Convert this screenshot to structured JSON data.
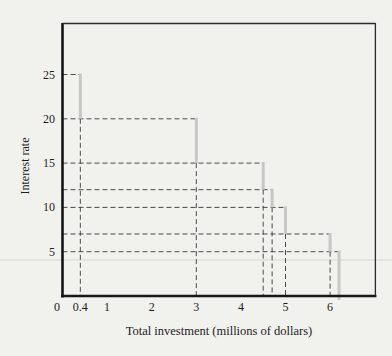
{
  "page": {
    "background_color": "#f1f1ee"
  },
  "chart_data": {
    "type": "step",
    "title": "",
    "xlabel": "Total investment (millions of dollars)",
    "ylabel": "Interest rate",
    "x_tick_values": [
      0,
      0.4,
      1,
      2,
      3,
      4,
      5,
      6
    ],
    "x_tick_labels": [
      "0",
      "0.4",
      "1",
      "2",
      "3",
      "4",
      "5",
      "6"
    ],
    "y_tick_values": [
      5,
      10,
      15,
      20,
      25
    ],
    "y_tick_labels": [
      "5",
      "10",
      "15",
      "20",
      "25"
    ],
    "xlim": [
      0,
      7
    ],
    "ylim": [
      0,
      30.8
    ],
    "grid": false,
    "legend": null,
    "steps": [
      {
        "x": 0.4,
        "y_from": 25,
        "y_to": 20
      },
      {
        "x": 3.0,
        "y_from": 20,
        "y_to": 15
      },
      {
        "x": 4.5,
        "y_from": 15,
        "y_to": 12
      },
      {
        "x": 4.7,
        "y_from": 12,
        "y_to": 10
      },
      {
        "x": 5.0,
        "y_from": 10,
        "y_to": 7
      },
      {
        "x": 6.0,
        "y_from": 7,
        "y_to": 5
      },
      {
        "x": 6.2,
        "y_from": 5,
        "y_to": 0
      }
    ],
    "guide_style": "dashed lines from each step corner to both axes",
    "colors": {
      "step_line": "#c5c8c4",
      "dashed_guide": "#4a4a4a",
      "axis": "#161616",
      "frame": "#2a2a2a",
      "text": "#1c1c1c",
      "scan_artifact_line": "#dfe1dc"
    }
  }
}
